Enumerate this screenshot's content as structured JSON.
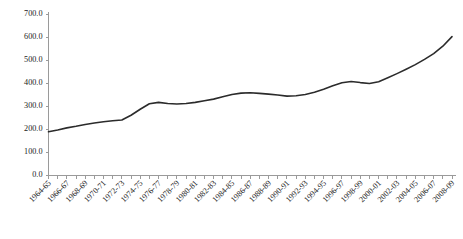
{
  "chart_data": {
    "type": "line",
    "title": "",
    "subtitle": "",
    "xlabel": "",
    "ylabel": "",
    "ylim": [
      0,
      700
    ],
    "ytick_labels": [
      "0.0",
      "100.0",
      "200.0",
      "300.0",
      "400.0",
      "500.0",
      "600.0",
      "700.0"
    ],
    "ytick_values": [
      0,
      100,
      200,
      300,
      400,
      500,
      600,
      700
    ],
    "grid": false,
    "legend": false,
    "legend_position": "none",
    "x": [
      "1964-65",
      "1965-66",
      "1966-67",
      "1967-68",
      "1968-69",
      "1969-70",
      "1970-71",
      "1971-72",
      "1972-73",
      "1973-74",
      "1974-75",
      "1975-76",
      "1976-77",
      "1977-78",
      "1978-79",
      "1979-80",
      "1980-81",
      "1981-82",
      "1982-83",
      "1983-84",
      "1984-85",
      "1985-86",
      "1986-87",
      "1987-88",
      "1988-89",
      "1989-90",
      "1990-91",
      "1991-92",
      "1992-93",
      "1993-94",
      "1994-95",
      "1995-96",
      "1996-97",
      "1997-98",
      "1998-99",
      "1999-00",
      "2000-01",
      "2001-02",
      "2002-03",
      "2003-04",
      "2004-05",
      "2005-06",
      "2006-07",
      "2007-08",
      "2008-09"
    ],
    "xtick_labels_shown": [
      "1964-65",
      "1966-67",
      "1968-69",
      "1970-71",
      "1972-73",
      "1974-75",
      "1976-77",
      "1978-79",
      "1980-81",
      "1982-83",
      "1984-85",
      "1986-87",
      "1988-89",
      "1990-91",
      "1992-93",
      "1994-95",
      "1996-97",
      "1998-99",
      "2000-01",
      "2002-03",
      "2004-05",
      "2006-07",
      "2008-09"
    ],
    "xtick_label_interval": 2,
    "values": [
      190,
      198,
      207,
      214,
      222,
      228,
      234,
      238,
      241,
      262,
      288,
      312,
      318,
      313,
      311,
      313,
      318,
      325,
      332,
      342,
      352,
      358,
      360,
      357,
      354,
      350,
      345,
      347,
      352,
      362,
      375,
      390,
      403,
      409,
      404,
      400,
      408,
      425,
      443,
      462,
      482,
      505,
      530,
      562,
      604
    ],
    "series_name": "",
    "line_color": "#2b2b2b"
  }
}
